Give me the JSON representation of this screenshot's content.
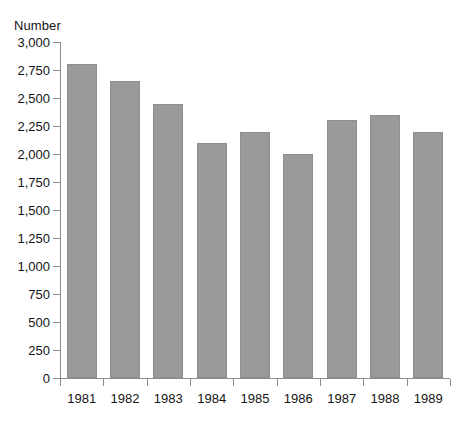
{
  "chart_data": {
    "type": "bar",
    "title": "",
    "ylabel": "Number",
    "xlabel": "",
    "categories": [
      "1981",
      "1982",
      "1983",
      "1984",
      "1985",
      "1986",
      "1987",
      "1988",
      "1989"
    ],
    "values": [
      2800,
      2650,
      2450,
      2100,
      2200,
      2000,
      2300,
      2350,
      2200
    ],
    "ylim": [
      0,
      3000
    ],
    "ytick_values": [
      0,
      250,
      500,
      750,
      1000,
      1250,
      1500,
      1750,
      2000,
      2250,
      2500,
      2750,
      3000
    ],
    "ytick_labels": [
      "0",
      "250",
      "500",
      "750",
      "1,000",
      "1,250",
      "1,500",
      "1,750",
      "2,000",
      "2,250",
      "2,500",
      "2,750",
      "3,000"
    ],
    "grid": false,
    "legend": false,
    "legend_position": "none",
    "bar_color": "#9a9a9a",
    "bar_edge_color": "#8e8e8e",
    "axis_color": "#8c8c8c",
    "background_color": "#ffffff",
    "text_color": "#141414"
  }
}
